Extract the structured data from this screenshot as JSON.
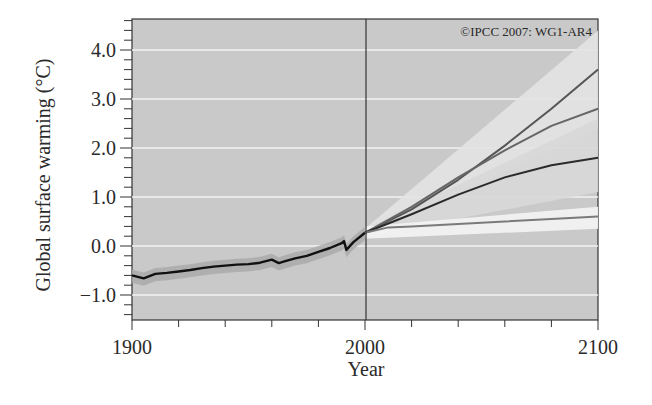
{
  "chart_data": {
    "type": "line",
    "title": "",
    "credit": "©IPCC 2007: WG1-AR4",
    "xlabel": "Year",
    "ylabel": "Global surface warming (°C)",
    "xlim": [
      1900,
      2100
    ],
    "ylim": [
      -1.5,
      4.6
    ],
    "x_ticks": [
      1900,
      2000,
      2100
    ],
    "x_tick_labels": [
      "1900",
      "2000",
      "2100"
    ],
    "y_ticks": [
      -1.0,
      0.0,
      1.0,
      2.0,
      3.0,
      4.0
    ],
    "y_tick_labels": [
      "−1.0",
      "0.0",
      "1.0",
      "2.0",
      "3.0",
      "4.0"
    ],
    "grid": true,
    "legend": "none",
    "divider_year": 2000,
    "series": [
      {
        "name": "20th century (observed/simulated)",
        "color": "#111111",
        "x": [
          1900,
          1905,
          1910,
          1915,
          1920,
          1925,
          1930,
          1935,
          1940,
          1945,
          1950,
          1955,
          1960,
          1963,
          1965,
          1970,
          1975,
          1980,
          1985,
          1990,
          1991,
          1992,
          1995,
          2000
        ],
        "values": [
          -0.6,
          -0.66,
          -0.57,
          -0.55,
          -0.52,
          -0.49,
          -0.45,
          -0.42,
          -0.4,
          -0.38,
          -0.37,
          -0.34,
          -0.28,
          -0.35,
          -0.32,
          -0.25,
          -0.2,
          -0.12,
          -0.04,
          0.06,
          0.1,
          -0.08,
          0.08,
          0.27
        ]
      },
      {
        "name": "A2",
        "color": "#555555",
        "x": [
          2000,
          2020,
          2040,
          2060,
          2080,
          2100
        ],
        "values": [
          0.27,
          0.75,
          1.35,
          2.05,
          2.8,
          3.6
        ]
      },
      {
        "name": "A1B",
        "color": "#666666",
        "x": [
          2000,
          2020,
          2040,
          2060,
          2080,
          2100
        ],
        "values": [
          0.27,
          0.8,
          1.4,
          1.95,
          2.45,
          2.8
        ]
      },
      {
        "name": "B1",
        "color": "#2a2a2a",
        "x": [
          2000,
          2020,
          2040,
          2060,
          2080,
          2100
        ],
        "values": [
          0.27,
          0.65,
          1.05,
          1.4,
          1.65,
          1.8
        ]
      },
      {
        "name": "Year 2000 constant concentrations",
        "color": "#7a7a7a",
        "x": [
          2000,
          2010,
          2020,
          2040,
          2060,
          2080,
          2100
        ],
        "values": [
          0.27,
          0.38,
          0.4,
          0.45,
          0.5,
          0.55,
          0.6
        ]
      }
    ],
    "uncertainty_bands": [
      {
        "name": "A2 range",
        "x": [
          2000,
          2100
        ],
        "lower": [
          0.2,
          2.4
        ],
        "upper": [
          0.35,
          4.4
        ]
      },
      {
        "name": "B1 range",
        "x": [
          2000,
          2100
        ],
        "lower": [
          0.2,
          1.1
        ],
        "upper": [
          0.35,
          2.6
        ]
      },
      {
        "name": "Constant range",
        "x": [
          2000,
          2100
        ],
        "lower": [
          0.15,
          0.35
        ],
        "upper": [
          0.4,
          0.8
        ]
      }
    ]
  }
}
